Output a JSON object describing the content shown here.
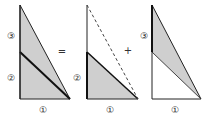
{
  "diagram": {
    "colors": {
      "fill": "#cfcfcf",
      "stroke": "#222222",
      "background": "#ffffff"
    },
    "operators": {
      "equals": "=",
      "plus": "+"
    },
    "panels": [
      {
        "name": "whole-triangle",
        "labels": {
          "side_top": "③",
          "side_bottom": "②",
          "base": "①"
        }
      },
      {
        "name": "lower-triangle",
        "labels": {
          "side": "②",
          "base": "①"
        }
      },
      {
        "name": "upper-sliver",
        "labels": {
          "side": "③",
          "base": "①"
        }
      }
    ]
  }
}
